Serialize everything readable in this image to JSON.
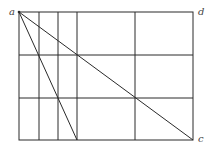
{
  "diagram": {
    "type": "geometric-construction",
    "labels": {
      "a": "a",
      "d": "d",
      "c": "c"
    },
    "rectangle": {
      "x1": 19,
      "y1": 12,
      "x2": 193,
      "y2": 140
    },
    "horizontal_lines_y": [
      55,
      98
    ],
    "vertical_lines_x": [
      39,
      58,
      77,
      135
    ],
    "diagonals": [
      {
        "name": "a-to-c",
        "from": [
          19,
          12
        ],
        "to": [
          193,
          140
        ]
      },
      {
        "name": "a-to-bottom",
        "from": [
          19,
          12
        ],
        "to": [
          77,
          140
        ]
      }
    ],
    "colors": {
      "line": "#2a2a2a",
      "label": "#444444",
      "background": "#ffffff"
    }
  }
}
